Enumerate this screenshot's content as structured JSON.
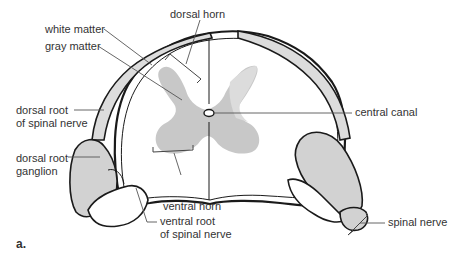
{
  "figure": {
    "panel_label": "a."
  },
  "labels": {
    "dorsal_horn": "dorsal horn",
    "white_matter": "white matter",
    "gray_matter": "gray matter",
    "dorsal_root_line1": "dorsal root",
    "dorsal_root_line2": "of spinal nerve",
    "ganglion_line1": "dorsal root",
    "ganglion_line2": "ganglion",
    "central_canal": "central canal",
    "ventral_horn": "ventral horn",
    "ventral_root_line1": "ventral root",
    "ventral_root_line2": "of spinal nerve",
    "spinal_nerve": "spinal nerve"
  },
  "colors": {
    "gray_matter": "#c8c8c8",
    "gray_matter_light": "#dcdcdc",
    "ganglion_fill": "#d2d2d2",
    "outline": "#1a1a1a",
    "leader_line": "#555555",
    "text": "#333333"
  }
}
